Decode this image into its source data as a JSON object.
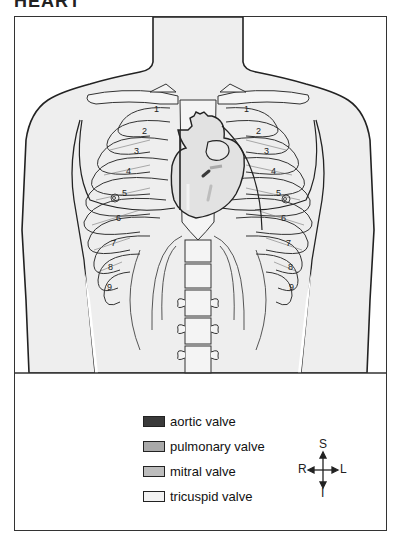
{
  "figure": {
    "title": "HEART"
  },
  "ribs": {
    "right_labels": [
      "1",
      "2",
      "3",
      "4",
      "5",
      "6",
      "7",
      "8",
      "9"
    ],
    "left_labels": [
      "1",
      "2",
      "3",
      "4",
      "5",
      "6",
      "7",
      "8",
      "9"
    ]
  },
  "legend": {
    "items": [
      {
        "label": "aortic valve",
        "color": "#3a3a3a"
      },
      {
        "label": "pulmonary valve",
        "color": "#a9a9a9"
      },
      {
        "label": "mitral valve",
        "color": "#bdbdbd"
      },
      {
        "label": "tricuspid valve",
        "color": "#f2f2f2"
      }
    ]
  },
  "compass": {
    "superior": "S",
    "inferior": "I",
    "right": "R",
    "left": "L"
  },
  "colors": {
    "body_fill": "#eeeeee",
    "outline": "#222222",
    "bone_fill": "#f4f4f4",
    "background": "#ffffff"
  }
}
